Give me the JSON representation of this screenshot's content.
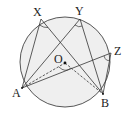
{
  "diagram": {
    "circle": {
      "center": "O",
      "cx": 65,
      "cy": 62,
      "r": 45,
      "fill": "#efefef",
      "stroke": "#444444"
    },
    "points": {
      "X": {
        "label": "X",
        "x": 41,
        "y": 19
      },
      "Y": {
        "label": "Y",
        "x": 80,
        "y": 19
      },
      "Z": {
        "label": "Z",
        "x": 111,
        "y": 53
      },
      "A": {
        "label": "A",
        "x": 22,
        "y": 88
      },
      "B": {
        "label": "B",
        "x": 103,
        "y": 94
      },
      "O": {
        "label": "O",
        "x": 65,
        "y": 63
      }
    },
    "labels": {
      "X": "X",
      "Y": "Y",
      "Z": "Z",
      "A": "A",
      "B": "B",
      "O": "O"
    },
    "segments_solid": [
      "AX",
      "XB",
      "AY",
      "YB",
      "AZ",
      "ZB"
    ],
    "segments_dashed": [
      "AO",
      "OB"
    ],
    "angle_marks": [
      "AXB",
      "AYB",
      "AZB",
      "AOB"
    ]
  }
}
